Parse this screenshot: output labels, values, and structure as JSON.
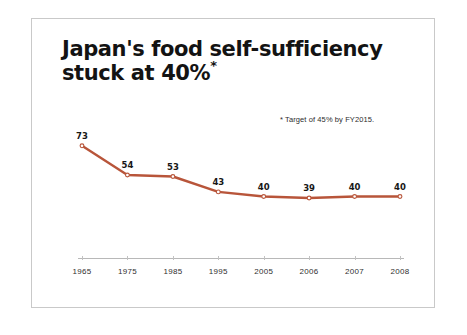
{
  "slide": {
    "title_line1": "Japan's food self-sufficiency",
    "title_line2": "stuck at 40%",
    "title_superscript": "*",
    "footnote": "* Target of 45% by FY2015."
  },
  "chart_data": {
    "type": "line",
    "title": "Japan's food self-sufficiency stuck at 40%",
    "subtitle": "* Target of 45% by FY2015.",
    "categories": [
      "1965",
      "1975",
      "1985",
      "1995",
      "2005",
      "2006",
      "2007",
      "2008"
    ],
    "values": [
      73,
      54,
      53,
      43,
      40,
      39,
      40,
      40
    ],
    "data_labels": [
      "73",
      "54",
      "53",
      "43",
      "40",
      "39",
      "40",
      "40"
    ],
    "xlabel": "",
    "ylabel": "",
    "ylim": [
      0,
      80
    ],
    "xlim_labels": [
      "1965",
      "2008"
    ],
    "grid": false,
    "legend": false,
    "series_color": "#b8553a",
    "marker_color": "#b8553a",
    "axis_color": "#b8b8b8",
    "label_color": "#171717",
    "units": "percent"
  }
}
